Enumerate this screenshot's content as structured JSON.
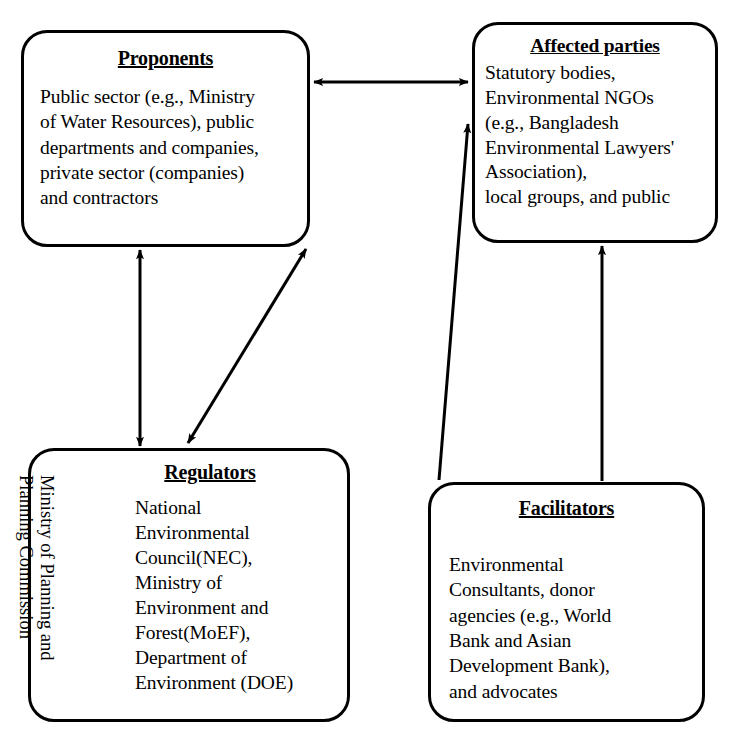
{
  "diagram": {
    "type": "stakeholder-relationship-diagram",
    "background_color": "#ffffff",
    "line_color": "#000000",
    "text_color": "#000000",
    "nodes": [
      {
        "id": "proponents",
        "title": "Proponents",
        "body": "Public sector (e.g., Ministry\nof Water Resources), public\ndepartments and companies,\nprivate sector (companies)\nand contractors"
      },
      {
        "id": "affected",
        "title": "Affected parties",
        "body": "Statutory bodies,\nEnvironmental NGOs\n(e.g., Bangladesh\nEnvironmental Lawyers'\nAssociation),\nlocal groups, and public"
      },
      {
        "id": "regulators",
        "title": "Regulators",
        "side_label": "Ministry of Planning and\nPlanning Commission",
        "body": "National\nEnvironmental\nCouncil(NEC),\nMinistry of\nEnvironment and\nForest(MoEF),\nDepartment of\nEnvironment (DOE)"
      },
      {
        "id": "facilitators",
        "title": "Facilitators",
        "body": "Environmental\nConsultants, donor\nagencies (e.g., World\nBank and Asian\nDevelopment Bank),\nand advocates"
      }
    ],
    "connectors": [
      {
        "id": "proponents-affected",
        "from": "proponents",
        "to": "affected",
        "style": "double-headed",
        "orientation": "horizontal"
      },
      {
        "id": "proponents-regulators-vertical",
        "from": "proponents",
        "to": "regulators",
        "style": "double-headed",
        "orientation": "vertical"
      },
      {
        "id": "proponents-regulators-diagonal",
        "from": "regulators",
        "to": "proponents",
        "style": "double-headed",
        "orientation": "diagonal"
      },
      {
        "id": "facilitators-affected",
        "from": "facilitators",
        "to": "affected",
        "style": "single-headed",
        "orientation": "diagonal"
      },
      {
        "id": "facilitators-affected-vertical",
        "from": "facilitators",
        "to": "affected",
        "style": "single-headed",
        "orientation": "vertical"
      }
    ]
  }
}
